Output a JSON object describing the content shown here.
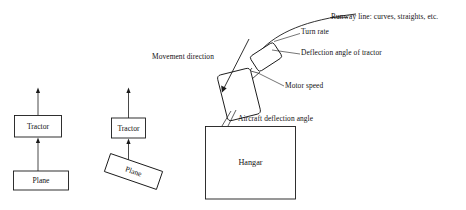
{
  "diagram": {
    "stroke_color": "#1a1a1a",
    "fill_color": "#ffffff",
    "background": "#ffffff"
  },
  "blocks": {
    "tractor_left": "Tractor",
    "plane_left": "Plane",
    "tractor_right": "Tractor",
    "plane_right": "Plane",
    "hangar": "Hangar"
  },
  "annotations": {
    "runway_line": "Runway line: curves, straights, etc.",
    "turn_rate": "Turn rate",
    "deflection_angle_of_tractor": "Deflection angle of tractor",
    "movement_direction": "Movement direction",
    "motor_speed": "Motor speed",
    "aircraft_deflection_angle": "Aircraft deflection angle"
  }
}
